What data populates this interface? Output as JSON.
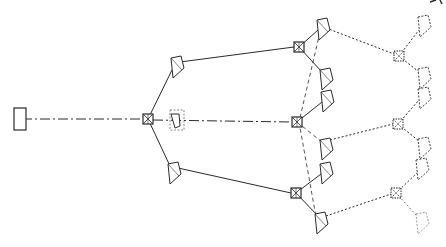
{
  "diagram": {
    "type": "tree-network-line-drawing",
    "background": "#ffffff",
    "ink_color": "#2a2a2a",
    "root": {
      "id": "root",
      "shape": "rectangle",
      "x": 14,
      "y": 108,
      "w": 12,
      "h": 22
    },
    "hub": {
      "id": "hub",
      "shape": "crossed-square",
      "x": 148,
      "y": 119
    },
    "hub_companion": {
      "id": "hub-companion",
      "shape": "kite-dashed-outline",
      "x": 176,
      "y": 120
    },
    "level1": [
      {
        "id": "l1-top",
        "shape": "kite",
        "x": 176,
        "y": 66
      },
      {
        "id": "l1-bottom",
        "shape": "kite",
        "x": 173,
        "y": 172
      }
    ],
    "level2_hubs": [
      {
        "id": "h2-top",
        "shape": "crossed-square",
        "x": 299,
        "y": 47
      },
      {
        "id": "h2-mid",
        "shape": "crossed-square",
        "x": 297,
        "y": 122
      },
      {
        "id": "h2-bottom",
        "shape": "crossed-square",
        "x": 296,
        "y": 193
      }
    ],
    "level2_leaves": [
      {
        "id": "l2-a",
        "shape": "kite",
        "x": 322,
        "y": 28
      },
      {
        "id": "l2-b",
        "shape": "kite",
        "x": 325,
        "y": 78
      },
      {
        "id": "l2-c",
        "shape": "kite",
        "x": 326,
        "y": 100
      },
      {
        "id": "l2-d",
        "shape": "kite",
        "x": 325,
        "y": 148
      },
      {
        "id": "l2-e",
        "shape": "kite",
        "x": 325,
        "y": 172
      },
      {
        "id": "l2-f",
        "shape": "kite",
        "x": 320,
        "y": 222
      }
    ],
    "level3_hubs": [
      {
        "id": "h3-top",
        "shape": "crossed-square-dotted",
        "x": 399,
        "y": 56
      },
      {
        "id": "h3-mid",
        "shape": "crossed-square-dotted",
        "x": 398,
        "y": 124
      },
      {
        "id": "h3-bottom",
        "shape": "crossed-square-dotted",
        "x": 396,
        "y": 193
      }
    ],
    "level3_leaves": [
      {
        "id": "l3-a",
        "shape": "kite-dotted",
        "x": 423,
        "y": 25
      },
      {
        "id": "l3-b",
        "shape": "kite-dotted",
        "x": 423,
        "y": 77
      },
      {
        "id": "l3-c",
        "shape": "kite-dotted",
        "x": 423,
        "y": 97
      },
      {
        "id": "l3-d",
        "shape": "kite-dotted",
        "x": 423,
        "y": 147
      },
      {
        "id": "l3-e",
        "shape": "kite-dotted",
        "x": 421,
        "y": 168
      },
      {
        "id": "l3-f",
        "shape": "kite-dotted-faint",
        "x": 421,
        "y": 222
      }
    ],
    "edges": {
      "root_to_hub": "dash-dot",
      "hub_to_level1": "solid",
      "level1_to_level2_hubs": "solid",
      "hub_to_mid_level2": "dash-dot",
      "level2_hubs_to_leaves": "solid",
      "level2_vertical_links": "dashed",
      "level2_to_level3": "dotted",
      "level3_hubs_to_leaves": "dotted"
    }
  }
}
